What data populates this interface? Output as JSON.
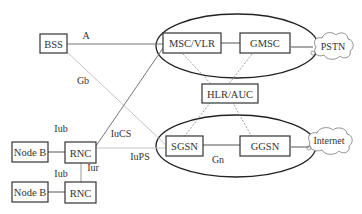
{
  "diagram": {
    "title": "",
    "nodes": [
      {
        "id": "bss",
        "label": "BSS"
      },
      {
        "id": "msc_vlr",
        "label": "MSC/VLR"
      },
      {
        "id": "gmsc",
        "label": "GMSC"
      },
      {
        "id": "pstn",
        "label": "PSTN"
      },
      {
        "id": "hlr_auc",
        "label": "HLR/AUC"
      },
      {
        "id": "sgsn",
        "label": "SGSN"
      },
      {
        "id": "ggsn",
        "label": "GGSN"
      },
      {
        "id": "internet",
        "label": "Internet"
      },
      {
        "id": "nodeb_1",
        "label": "Node B"
      },
      {
        "id": "rnc_1",
        "label": "RNC"
      },
      {
        "id": "nodeb_2",
        "label": "Node B"
      },
      {
        "id": "rnc_2",
        "label": "RNC"
      }
    ],
    "edges": [
      {
        "from": "bss",
        "to": "msc_vlr",
        "label": "A"
      },
      {
        "from": "bss",
        "to": "sgsn",
        "label": "Gb"
      },
      {
        "from": "rnc_1",
        "to": "msc_vlr",
        "label": "IuCS"
      },
      {
        "from": "rnc_1",
        "to": "sgsn",
        "label": "IuPS"
      },
      {
        "from": "nodeb_1",
        "to": "rnc_1",
        "label": "Iub"
      },
      {
        "from": "nodeb_2",
        "to": "rnc_2",
        "label": "Iub"
      },
      {
        "from": "rnc_1",
        "to": "rnc_2",
        "label": "Iur"
      },
      {
        "from": "sgsn",
        "to": "ggsn",
        "label": "Gn"
      },
      {
        "from": "msc_vlr",
        "to": "gmsc",
        "label": ""
      },
      {
        "from": "gmsc",
        "to": "pstn",
        "label": ""
      },
      {
        "from": "ggsn",
        "to": "internet",
        "label": ""
      },
      {
        "from": "msc_vlr",
        "to": "hlr_auc",
        "label": ""
      },
      {
        "from": "gmsc",
        "to": "hlr_auc",
        "label": ""
      },
      {
        "from": "sgsn",
        "to": "hlr_auc",
        "label": ""
      },
      {
        "from": "ggsn",
        "to": "hlr_auc",
        "label": ""
      }
    ],
    "groups": [
      {
        "id": "cs_domain",
        "members": [
          "msc_vlr",
          "gmsc"
        ]
      },
      {
        "id": "ps_domain",
        "members": [
          "sgsn",
          "ggsn"
        ]
      }
    ],
    "labels": {
      "bss": "BSS",
      "msc_vlr": "MSC/VLR",
      "gmsc": "GMSC",
      "pstn": "PSTN",
      "hlr_auc": "HLR/AUC",
      "sgsn": "SGSN",
      "ggsn": "GGSN",
      "internet": "Internet",
      "nodeb_1": "Node B",
      "rnc_1": "RNC",
      "nodeb_2": "Node B",
      "rnc_2": "RNC",
      "edge_a": "A",
      "edge_gb": "Gb",
      "edge_iucs": "IuCS",
      "edge_iups": "IuPS",
      "edge_iub_1": "Iub",
      "edge_iub_2": "Iub",
      "edge_iur": "Iur",
      "edge_gn": "Gn"
    },
    "colors": {
      "box_stroke": "#333333",
      "solid_line": "#555555",
      "light_line": "#bbbbbb",
      "dashed_line": "#777777",
      "ellipse_stroke": "#222222"
    }
  }
}
